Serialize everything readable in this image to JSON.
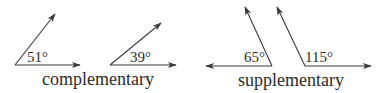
{
  "diagram": {
    "groups": [
      {
        "caption": "complementary",
        "angles": [
          {
            "label": "51°",
            "degrees": 51
          },
          {
            "label": "39°",
            "degrees": 39
          }
        ]
      },
      {
        "caption": "supplementary",
        "angles": [
          {
            "label": "65°",
            "degrees": 65
          },
          {
            "label": "115°",
            "degrees": 115
          }
        ]
      }
    ],
    "colors": {
      "line": "#3a3a3a",
      "text": "#2b2b2b",
      "background": "#ffffff"
    }
  }
}
